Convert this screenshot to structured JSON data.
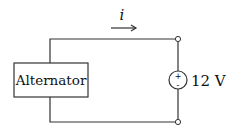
{
  "diagram": {
    "type": "circuit",
    "colors": {
      "line": "#333333",
      "text": "#111111",
      "background": "#ffffff"
    },
    "components": {
      "alternator": {
        "label": "Alternator"
      },
      "voltage_source": {
        "label": "12 V",
        "plus_sign": "+",
        "minus_sign": "-"
      },
      "current": {
        "label": "i",
        "direction": "right"
      }
    }
  }
}
